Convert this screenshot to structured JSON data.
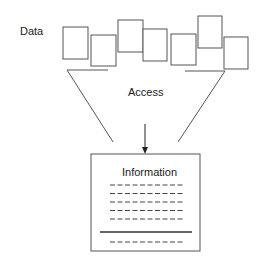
{
  "diagram": {
    "labels": {
      "data": "Data",
      "access": "Access",
      "information": "Information"
    },
    "data_boxes": [
      {
        "x": 63,
        "y": 27,
        "w": 25,
        "h": 32
      },
      {
        "x": 91,
        "y": 35,
        "w": 25,
        "h": 31
      },
      {
        "x": 118,
        "y": 20,
        "w": 25,
        "h": 32
      },
      {
        "x": 143,
        "y": 29,
        "w": 24,
        "h": 32
      },
      {
        "x": 171,
        "y": 34,
        "w": 25,
        "h": 31
      },
      {
        "x": 198,
        "y": 16,
        "w": 24,
        "h": 32
      },
      {
        "x": 224,
        "y": 37,
        "w": 24,
        "h": 32
      }
    ],
    "dashed_rows": 5,
    "dashed_rows_after_rule": 1,
    "colors": {
      "stroke": "#555555",
      "text": "#222222",
      "rule": "#333333"
    }
  }
}
